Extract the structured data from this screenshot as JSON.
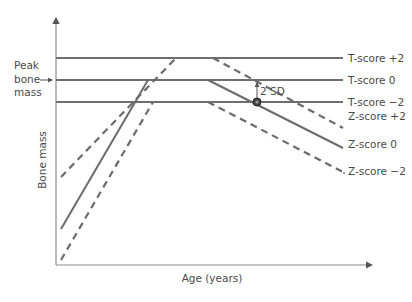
{
  "diagram": {
    "title": "",
    "y_axis_label": "Bone mass",
    "x_axis_label": "Age (years)",
    "peak_label_lines": [
      "Peak",
      "bone",
      "mass"
    ],
    "reference_lines": [
      {
        "id": "t-plus2",
        "label": "T-score +2"
      },
      {
        "id": "t-0",
        "label": "T-score 0"
      },
      {
        "id": "t-minus2",
        "label": "T-score −2"
      }
    ],
    "curves": [
      {
        "id": "z-plus2",
        "label": "Z-score +2",
        "style": "dashed"
      },
      {
        "id": "z-0",
        "label": "Z-score 0",
        "style": "solid"
      },
      {
        "id": "z-minus2",
        "label": "Z-score −2",
        "style": "dashed"
      }
    ],
    "sd_annotation": "2 SD",
    "colors": {
      "lines": "#6b6b6b",
      "text": "#4a4a4a",
      "axis": "#8a8a8a"
    }
  }
}
